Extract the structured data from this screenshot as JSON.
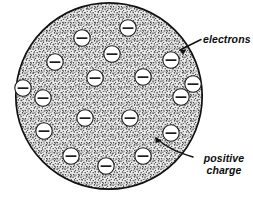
{
  "figure": {
    "background_color": "#ffffff",
    "ink_color": "#111111"
  },
  "atom": {
    "name": "atom-sphere",
    "description": "Large stippled circle representing the positively charged sphere",
    "center_x": 109,
    "center_y": 96,
    "radius": 94,
    "fill_style": "stipple",
    "fill_color": "#e8e8e8",
    "stipple_color": "#2b2b2b",
    "outline_color": "#111111",
    "outline_width": 1.6
  },
  "electrons": {
    "name": "electron-group",
    "count": 18,
    "symbol": "minus",
    "radius": 8.2,
    "fill_color": "#ffffff",
    "outline_color": "#1a1a1a",
    "positions": [
      {
        "x": 82,
        "y": 38
      },
      {
        "x": 128,
        "y": 28
      },
      {
        "x": 55,
        "y": 62
      },
      {
        "x": 171,
        "y": 60
      },
      {
        "x": 95,
        "y": 78
      },
      {
        "x": 143,
        "y": 77
      },
      {
        "x": 43,
        "y": 98
      },
      {
        "x": 181,
        "y": 97
      },
      {
        "x": 85,
        "y": 118
      },
      {
        "x": 130,
        "y": 118
      },
      {
        "x": 44,
        "y": 131
      },
      {
        "x": 171,
        "y": 133
      },
      {
        "x": 71,
        "y": 156
      },
      {
        "x": 143,
        "y": 156
      },
      {
        "x": 106,
        "y": 166
      },
      {
        "x": 23,
        "y": 88
      },
      {
        "x": 193,
        "y": 84
      },
      {
        "x": 112,
        "y": 54
      }
    ]
  },
  "annotations": {
    "electrons": {
      "name": "electrons-label",
      "text": "electrons",
      "x": 203,
      "y": 34,
      "leader": {
        "name": "electrons-leader-line",
        "type": "arrow",
        "from_x": 200,
        "from_y": 40,
        "to_x": 176,
        "to_y": 53
      }
    },
    "positive_charge": {
      "name": "positive-charge-label",
      "line1": "positive",
      "line2": "charge",
      "x": 196,
      "y": 153,
      "leader": {
        "name": "positive-charge-leader-line",
        "type": "curved-arrow",
        "from_x": 192,
        "from_y": 158,
        "to_x": 151,
        "to_y": 140
      }
    }
  }
}
